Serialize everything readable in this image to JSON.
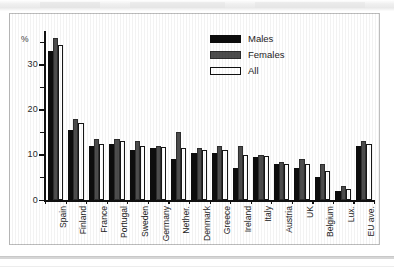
{
  "chart_data": {
    "type": "bar",
    "title": "",
    "xlabel": "",
    "ylabel": "%",
    "ylim": [
      0,
      37.5
    ],
    "yticks": [
      0,
      10,
      20,
      30
    ],
    "ytick_labels": [
      "0",
      "10",
      "20",
      "30"
    ],
    "yminor_ticks": [
      5,
      15,
      25,
      35
    ],
    "grid": false,
    "legend_position": "top-right",
    "categories": [
      "Spain",
      "Finland",
      "France",
      "Portugal",
      "Sweden",
      "Germany",
      "Nether.",
      "Denmark",
      "Greece",
      "Ireland",
      "Italy",
      "Austria",
      "UK",
      "Belgium",
      "Lux.",
      "EU ave."
    ],
    "series": [
      {
        "name": "Males",
        "color": "#0d0d0d",
        "values": [
          33.0,
          15.5,
          12.0,
          12.5,
          11.0,
          11.5,
          9.0,
          10.5,
          10.5,
          7.0,
          9.5,
          8.0,
          7.0,
          5.0,
          2.0,
          12.0
        ]
      },
      {
        "name": "Females",
        "color": "#4d4d4d",
        "values": [
          36.0,
          18.0,
          13.5,
          13.5,
          13.0,
          12.0,
          15.0,
          11.5,
          12.0,
          12.0,
          10.0,
          8.5,
          9.0,
          8.0,
          3.0,
          13.0
        ]
      },
      {
        "name": "All",
        "color": "#ffffff",
        "values": [
          34.5,
          17.0,
          12.5,
          13.0,
          12.0,
          11.8,
          11.5,
          11.0,
          11.2,
          10.0,
          9.8,
          8.0,
          8.0,
          6.5,
          2.5,
          12.5
        ]
      }
    ]
  },
  "legend": {
    "entries": [
      {
        "label": "Males",
        "swatch": "solid-black-swatch"
      },
      {
        "label": "Females",
        "swatch": "solid-gray-swatch"
      },
      {
        "label": "All",
        "swatch": "outline-white-swatch"
      }
    ]
  },
  "axes": {
    "y_unit_label": "%"
  }
}
